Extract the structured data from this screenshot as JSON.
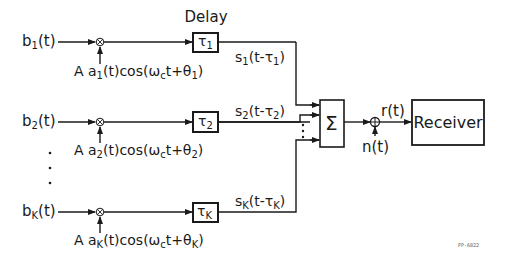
{
  "diagram": {
    "title_label": "Delay",
    "inputs": [
      {
        "name": "b",
        "sub": "1",
        "suffix": "(t)"
      },
      {
        "name": "b",
        "sub": "2",
        "suffix": "(t)"
      },
      {
        "name": "b",
        "sub": "K",
        "suffix": "(t)"
      }
    ],
    "carriers": [
      {
        "pre": "A a",
        "sub": "1",
        "mid": "(t)cos(ω",
        "wsub": "c",
        "post": "t+θ",
        "tsub": "1",
        "end": ")"
      },
      {
        "pre": "A a",
        "sub": "2",
        "mid": "(t)cos(ω",
        "wsub": "c",
        "post": "t+θ",
        "tsub": "2",
        "end": ")"
      },
      {
        "pre": "A a",
        "sub": "K",
        "mid": "(t)cos(ω",
        "wsub": "c",
        "post": "t+θ",
        "tsub": "K",
        "end": ")"
      }
    ],
    "delays": [
      {
        "sym": "τ",
        "sub": "1"
      },
      {
        "sym": "τ",
        "sub": "2"
      },
      {
        "sym": "τ",
        "sub": "K"
      }
    ],
    "delayed_signals": [
      {
        "pre": "s",
        "sub": "1",
        "mid": "(t-τ",
        "sub2": "1",
        "end": ")"
      },
      {
        "pre": "s",
        "sub": "2",
        "mid": "(t-τ",
        "sub2": "2",
        "end": ")"
      },
      {
        "pre": "s",
        "sub": "K",
        "mid": "(t-τ",
        "sub2": "K",
        "end": ")"
      }
    ],
    "summer_symbol": "Σ",
    "received_signal": "r(t)",
    "noise": "n(t)",
    "receiver_label": "Receiver",
    "figure_id": "FP-6822",
    "vertical_ellipsis": "⋮",
    "colors": {
      "line": "#1a1a1a",
      "background": "#ffffff"
    }
  }
}
